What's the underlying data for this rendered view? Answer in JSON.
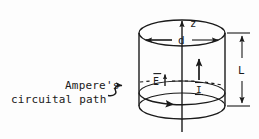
{
  "figure": {
    "background_color": "#fdfdfd",
    "ink_color": "#1a1a1a"
  },
  "labels": {
    "axis_z": "z",
    "diameter": "d",
    "length": "L",
    "efield": "E",
    "efield_overbar": "‾",
    "current": "I",
    "callout_line1": "Ampere's",
    "callout_line2": "circuital path"
  },
  "icons": {
    "z_axis_arrow": "arrow-up-icon",
    "diameter_arrows": "double-arrow-horizontal-icon",
    "length_arrows": "double-arrow-vertical-icon",
    "efield_arrow": "arrow-up-small-icon",
    "current_arrow": "arrow-up-bold-icon",
    "loop_direction_arrow": "arrow-right-on-path-icon",
    "callout_leader": "curved-leader-arrow-icon"
  },
  "geometry": {
    "cylinder_top_ellipse": {
      "cx": 182,
      "cy": 33,
      "rx": 43,
      "ry": 13
    },
    "cylinder_bottom_ellipse": {
      "cx": 182,
      "cy": 106,
      "rx": 43,
      "ry": 13
    },
    "amperian_loop_ellipse": {
      "cx": 182,
      "cy": 93,
      "rx": 43,
      "ry": 12
    },
    "axis_x": 182,
    "axis_top_y": 17,
    "axis_bottom_y": 132,
    "dimension_d_y": 40,
    "dimension_L_x": 242,
    "dimension_L_top_y": 33,
    "dimension_L_bottom_y": 106
  }
}
